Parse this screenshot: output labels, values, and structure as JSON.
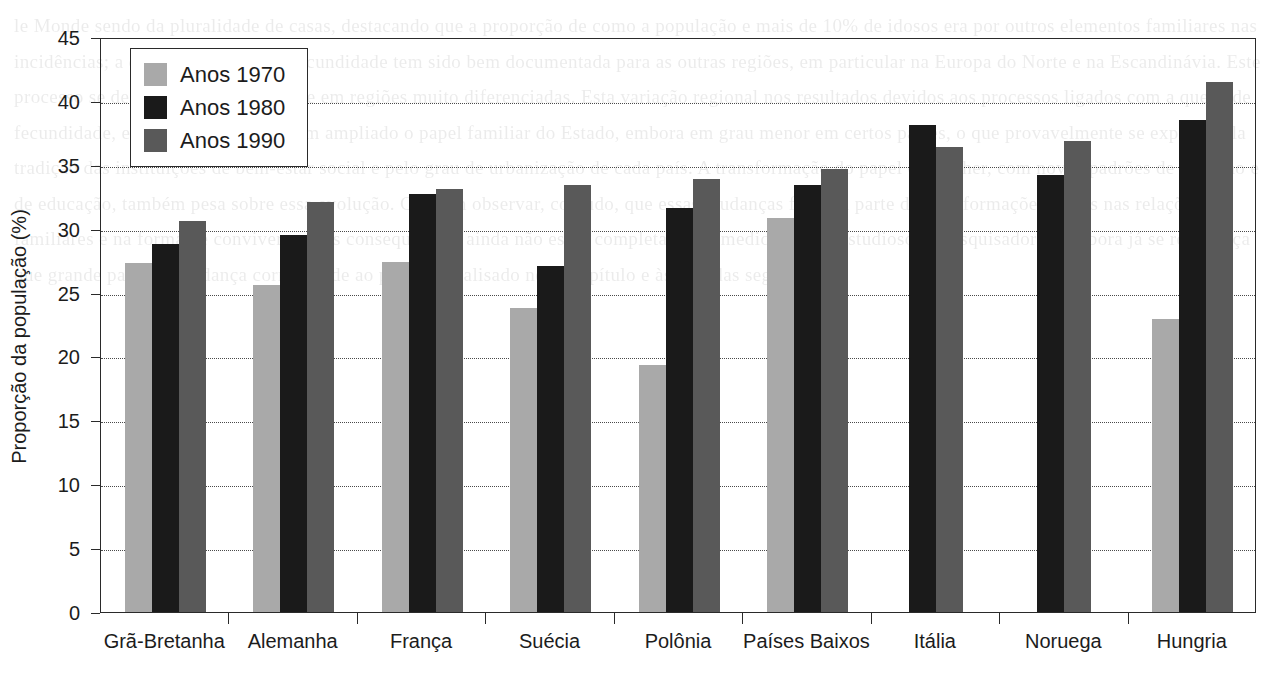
{
  "chart_data": {
    "type": "bar",
    "title": "",
    "xlabel": "",
    "ylabel": "Proporção da população (%)",
    "ylim": [
      0,
      45
    ],
    "y_ticks": [
      0,
      5,
      10,
      15,
      20,
      25,
      30,
      35,
      40,
      45
    ],
    "grid": "horizontal-dotted",
    "legend_position": "top-left-inside",
    "categories": [
      "Grã-Bretanha",
      "Alemanha",
      "França",
      "Suécia",
      "Polônia",
      "Países Baixos",
      "Itália",
      "Noruega",
      "Hungria"
    ],
    "series": [
      {
        "name": "Anos 1970",
        "color": "#a9a9a9",
        "values": [
          27.3,
          25.6,
          27.4,
          23.8,
          19.3,
          30.8,
          null,
          null,
          22.9
        ]
      },
      {
        "name": "Anos 1980",
        "color": "#1a1a1a",
        "values": [
          28.8,
          29.5,
          32.7,
          27.1,
          31.6,
          33.4,
          38.1,
          34.2,
          38.5
        ]
      },
      {
        "name": "Anos 1990",
        "color": "#595959",
        "values": [
          30.6,
          32.1,
          33.1,
          33.4,
          33.9,
          34.7,
          36.4,
          36.9,
          41.5
        ]
      }
    ]
  },
  "legend": {
    "entries": [
      {
        "label": "Anos 1970",
        "color": "#a9a9a9"
      },
      {
        "label": "Anos 1980",
        "color": "#1a1a1a"
      },
      {
        "label": "Anos 1990",
        "color": "#595959"
      }
    ]
  },
  "page_background_text": "le Monde sendo da pluralidade de casas, destacando que a proporção de como a população e mais de 10% de idosos era por outros elementos familiares nas incidências; a queda nos níveis de fecundidade tem sido bem documentada para as outras regiões, em particular na Europa do Norte e na Escandinávia. Este processo se desenvolveu em tempos e em regiões muito diferenciadas. Esta variação regional nos resultados devidos aos processos ligados com a queda de fecundidade, e as políticas sociais têm ampliado o papel familiar do Estado, embora em grau menor em certos países, o que provavelmente se explica pela tradição das instituições de bem-estar social e pelo grau de urbanização de cada país. A transformação do papel da mulher, com novos padrões de trabalho e de educação, também pesa sobre essa evolução. Convém observar, contudo, que essas mudanças fizeram parte de transformações gerais nas relações familiares e na forma de conviver, e suas consequências ainda não estão completamente medidas pelos estudiosos e pesquisadores, embora já se reconheça que grande parte da mudança corresponde ao período analisado neste capítulo e às décadas seguintes."
}
